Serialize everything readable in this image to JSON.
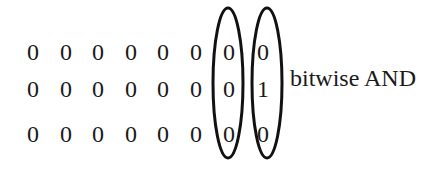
{
  "diagram": {
    "rows": [
      [
        "0",
        "0",
        "0",
        "0",
        "0",
        "0",
        "0",
        "0"
      ],
      [
        "0",
        "0",
        "0",
        "0",
        "0",
        "0",
        "0",
        "1"
      ],
      [
        "0",
        "0",
        "0",
        "0",
        "0",
        "0",
        "0",
        "0"
      ]
    ],
    "highlighted_columns": [
      6,
      7
    ],
    "operation_label": "bitwise AND"
  }
}
